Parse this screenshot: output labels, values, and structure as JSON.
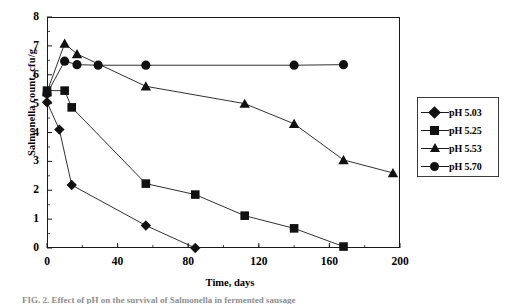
{
  "figure": {
    "background_color": "#ffffff",
    "axis_color": "#1a1a1a",
    "marker_color": "#111111",
    "caption_partial": "FIG. 2. Effect of pH on the survival of Salmonella in fermented sausage"
  },
  "chart_data": {
    "type": "line",
    "title": "",
    "xlabel": "Time, days",
    "ylabel": "Salmonella count, cfu/g",
    "xlim": [
      0,
      200
    ],
    "ylim": [
      0,
      8
    ],
    "xticks": [
      0,
      40,
      80,
      120,
      160,
      200
    ],
    "yticks": [
      0,
      1,
      2,
      3,
      4,
      5,
      6,
      7,
      8
    ],
    "grid": false,
    "legend_position": "right",
    "series": [
      {
        "name": "pH 5.03",
        "marker": "diamond",
        "x": [
          0,
          7,
          14,
          56,
          84
        ],
        "y": [
          5.05,
          4.1,
          2.18,
          0.78,
          0.0
        ]
      },
      {
        "name": "pH 5.25",
        "marker": "square",
        "x": [
          0,
          10,
          14,
          56,
          84,
          112,
          140,
          168
        ],
        "y": [
          5.45,
          5.45,
          4.87,
          2.23,
          1.85,
          1.12,
          0.68,
          0.05
        ]
      },
      {
        "name": "pH 5.53",
        "marker": "triangle",
        "x": [
          0,
          10,
          17,
          56,
          112,
          140,
          168,
          196
        ],
        "y": [
          5.4,
          7.08,
          6.72,
          5.6,
          5.0,
          4.3,
          3.05,
          2.6
        ]
      },
      {
        "name": "pH 5.70",
        "marker": "circle",
        "x": [
          0,
          10,
          17,
          29,
          56,
          140,
          168
        ],
        "y": [
          5.35,
          6.47,
          6.35,
          6.33,
          6.33,
          6.33,
          6.35
        ]
      }
    ]
  },
  "legend": {
    "items": [
      {
        "label": "pH 5.03",
        "marker": "diamond"
      },
      {
        "label": "pH 5.25",
        "marker": "square"
      },
      {
        "label": "pH 5.53",
        "marker": "triangle"
      },
      {
        "label": "pH 5.70",
        "marker": "circle"
      }
    ]
  }
}
